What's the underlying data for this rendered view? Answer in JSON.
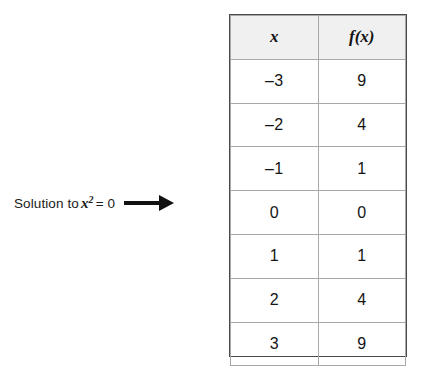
{
  "annotation": {
    "lead_text": "Solution to",
    "variable": "x",
    "exponent": "2",
    "equation_tail": "= 0",
    "arrow_icon": "right-arrow-icon"
  },
  "chart_data": {
    "type": "table",
    "title": "",
    "columns": [
      "x",
      "f(x)"
    ],
    "categories": [
      "-3",
      "-2",
      "-1",
      "0",
      "1",
      "2",
      "3"
    ],
    "series": [
      {
        "name": "f(x)",
        "values": [
          9,
          4,
          1,
          0,
          1,
          4,
          9
        ]
      }
    ],
    "rows": [
      {
        "x": "–3",
        "fx": "9"
      },
      {
        "x": "–2",
        "fx": "4"
      },
      {
        "x": "–1",
        "fx": "1"
      },
      {
        "x": "0",
        "fx": "0"
      },
      {
        "x": "1",
        "fx": "1"
      },
      {
        "x": "2",
        "fx": "4"
      },
      {
        "x": "3",
        "fx": "9"
      }
    ],
    "xlabel": "x",
    "ylabel": "f(x)",
    "annotation": "Solution to x2 = 0",
    "highlighted_row_index": 3,
    "header_fill": "#f0f0f0",
    "border_color": "#4a4a4a",
    "grid_color": "#a8a8a8",
    "text_color": "#141414"
  }
}
